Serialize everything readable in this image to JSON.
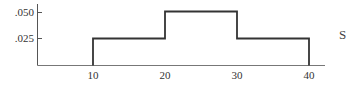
{
  "chart_data": {
    "type": "line",
    "subtype": "step",
    "title": "",
    "xlabel": "",
    "ylabel": "",
    "x_ticks": [
      10,
      20,
      30,
      40
    ],
    "x_tick_labels": [
      "10",
      "20",
      "30",
      "40"
    ],
    "y_ticks": [
      0.025,
      0.05
    ],
    "y_tick_labels": [
      ".025",
      ".050"
    ],
    "xlim": [
      0,
      42
    ],
    "ylim": [
      0,
      0.06
    ],
    "grid": false,
    "legend": null,
    "series": [
      {
        "name": "density",
        "segments": [
          {
            "x_start": 10,
            "x_end": 20,
            "y": 0.025
          },
          {
            "x_start": 20,
            "x_end": 30,
            "y": 0.05
          },
          {
            "x_start": 30,
            "x_end": 40,
            "y": 0.025
          }
        ],
        "x": [
          10,
          10,
          20,
          20,
          30,
          30,
          40,
          40
        ],
        "y": [
          0,
          0.025,
          0.025,
          0.05,
          0.05,
          0.025,
          0.025,
          0
        ]
      }
    ],
    "line_color": "#333333",
    "axis_color": "#555555"
  },
  "labels": {
    "y_050": ".050",
    "y_025": ".025",
    "x_10": "10",
    "x_20": "20",
    "x_30": "30",
    "x_40": "40",
    "edge_glyph": "S"
  }
}
